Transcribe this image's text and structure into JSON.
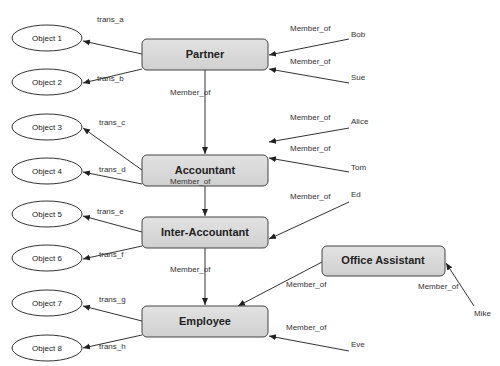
{
  "diagram": {
    "roles": [
      {
        "id": "partner",
        "label": "Partner",
        "x": 142,
        "y": 39,
        "w": 126,
        "h": 31
      },
      {
        "id": "accountant",
        "label": "Accountant",
        "x": 142,
        "y": 155,
        "w": 126,
        "h": 31
      },
      {
        "id": "inter_accountant",
        "label": "Inter-Accountant",
        "x": 142,
        "y": 217,
        "w": 126,
        "h": 31
      },
      {
        "id": "employee",
        "label": "Employee",
        "x": 142,
        "y": 306,
        "w": 126,
        "h": 31
      },
      {
        "id": "office_assistant",
        "label": "Office Assistant",
        "x": 322,
        "y": 246,
        "w": 123,
        "h": 30
      }
    ],
    "objects": [
      {
        "label": "Object 1",
        "cx": 47,
        "cy": 38
      },
      {
        "label": "Object 2",
        "cx": 47,
        "cy": 82
      },
      {
        "label": "Object 3",
        "cx": 47,
        "cy": 127
      },
      {
        "label": "Object 4",
        "cx": 47,
        "cy": 171
      },
      {
        "label": "Object 5",
        "cx": 47,
        "cy": 214
      },
      {
        "label": "Object 6",
        "cx": 47,
        "cy": 258
      },
      {
        "label": "Object 7",
        "cx": 47,
        "cy": 303
      },
      {
        "label": "Object 8",
        "cx": 47,
        "cy": 348
      }
    ],
    "users": [
      {
        "label": "Bob",
        "x": 351,
        "y": 37
      },
      {
        "label": "Sue",
        "x": 351,
        "y": 80
      },
      {
        "label": "Alice",
        "x": 351,
        "y": 124
      },
      {
        "label": "Tom",
        "x": 351,
        "y": 170
      },
      {
        "label": "Ed",
        "x": 351,
        "y": 197
      },
      {
        "label": "Mike",
        "x": 474,
        "y": 316
      },
      {
        "label": "Eve",
        "x": 351,
        "y": 347
      }
    ],
    "transaction_labels": [
      {
        "label": "trans_a",
        "x": 97,
        "y": 22
      },
      {
        "label": "trans_b",
        "x": 97,
        "y": 81
      },
      {
        "label": "trans_c",
        "x": 99,
        "y": 125
      },
      {
        "label": "trans_d",
        "x": 99,
        "y": 172
      },
      {
        "label": "trans_e",
        "x": 97,
        "y": 214
      },
      {
        "label": "trans_f",
        "x": 99,
        "y": 257
      },
      {
        "label": "trans_g",
        "x": 99,
        "y": 302
      },
      {
        "label": "trans_h",
        "x": 99,
        "y": 349
      }
    ],
    "member_of_labels": [
      {
        "label": "Member_of",
        "x": 290,
        "y": 31
      },
      {
        "label": "Member_of",
        "x": 290,
        "y": 64
      },
      {
        "label": "Member_of",
        "x": 170,
        "y": 95
      },
      {
        "label": "Member_of",
        "x": 290,
        "y": 120
      },
      {
        "label": "Member_of",
        "x": 290,
        "y": 151
      },
      {
        "label": "Member_of",
        "x": 170,
        "y": 184
      },
      {
        "label": "Member_of",
        "x": 290,
        "y": 199
      },
      {
        "label": "Member_of",
        "x": 170,
        "y": 272
      },
      {
        "label": "Member_of",
        "x": 286,
        "y": 287
      },
      {
        "label": "Member_of",
        "x": 418,
        "y": 289
      },
      {
        "label": "Member_of",
        "x": 286,
        "y": 330
      }
    ]
  }
}
